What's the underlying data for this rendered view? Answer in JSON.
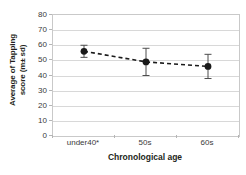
{
  "chart_data": {
    "type": "line",
    "title": "",
    "subtitle": "",
    "xlabel": "Chronological age",
    "ylabel": "Average of Tapping score (m± sd)",
    "ylabel_line1": "Average of Tapping",
    "ylabel_line2": "score  (m± sd)",
    "categories": [
      "under40*",
      "50s",
      "60s"
    ],
    "values": [
      56,
      49,
      46
    ],
    "errors": [
      4,
      9,
      8
    ],
    "error_low": [
      52,
      40,
      38
    ],
    "error_high": [
      60,
      58,
      54
    ],
    "ylim": [
      0,
      80
    ],
    "yticks": [
      0,
      10,
      20,
      30,
      40,
      50,
      60,
      70,
      80
    ],
    "ytick_labels": [
      "0",
      "10",
      "20",
      "30",
      "40",
      "50",
      "60",
      "70",
      "80"
    ],
    "grid": true,
    "legend": "none",
    "line_style": "dashed",
    "marker": "circle",
    "series": [
      {
        "name": "Average of Tapping score",
        "values": [
          56,
          49,
          46
        ],
        "errors": [
          4,
          9,
          8
        ]
      }
    ],
    "colors": {
      "line": "#1a1a1a",
      "marker": "#1a1a1a",
      "error_bar": "#4d4d4d",
      "gridline": "#d8d8d8",
      "axis": "#c9c9c9",
      "text": "#3a3a3a",
      "background": "#ffffff"
    },
    "annotations": [
      "* significance marker on under40 category"
    ]
  }
}
